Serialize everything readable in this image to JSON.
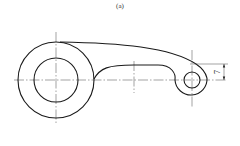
{
  "figure": {
    "caption": "(a)",
    "dimension": {
      "value": "7",
      "orientation": "vertical"
    },
    "colors": {
      "line": "#1a1a1a",
      "centerline": "#444444",
      "background": "#ffffff"
    }
  }
}
